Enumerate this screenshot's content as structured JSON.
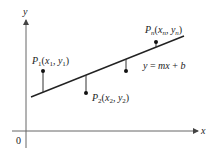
{
  "diagram": {
    "colors": {
      "background": "#ffffff",
      "axis": "#555555",
      "line": "#222222",
      "text": "#222222"
    },
    "axes": {
      "x_label": "x",
      "y_label": "y",
      "origin_label": "0"
    },
    "regression_line": {
      "label": "y = mx + b",
      "label_parts": {
        "lhs": "y",
        "eq": " = ",
        "m": "m",
        "x": "x",
        "plus": " + ",
        "b": "b"
      }
    },
    "points": [
      {
        "id": "P1",
        "name": "P",
        "sub": "1",
        "x_var": "x",
        "x_sub": "1",
        "y_var": "y",
        "y_sub": "1",
        "position": "above line"
      },
      {
        "id": "P2",
        "name": "P",
        "sub": "2",
        "x_var": "x",
        "x_sub": "2",
        "y_var": "y",
        "y_sub": "2",
        "position": "below line"
      },
      {
        "id": "P3",
        "unlabeled": true,
        "position": "below line"
      },
      {
        "id": "Pn",
        "name": "P",
        "sub": "n",
        "x_var": "x",
        "x_sub": "n",
        "y_var": "y",
        "y_sub": "n",
        "position": "above line"
      }
    ]
  }
}
